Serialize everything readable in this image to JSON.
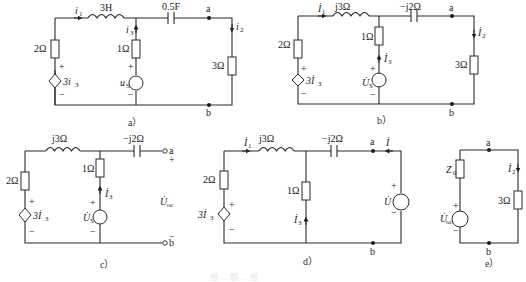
{
  "figure": {
    "caption_faint": "图 … 题 … 图",
    "panels": [
      {
        "id": "a",
        "caption": "a）",
        "elements": {
          "inductor": "3H",
          "capacitor": "0.5F",
          "left_resistor": "2Ω",
          "middle_resistor": "1Ω",
          "right_resistor": "3Ω",
          "dependent_source": "3i",
          "dependent_source_sub": "3",
          "source": "u",
          "source_sub": "S",
          "current_1": "i",
          "current_1_sub": "1",
          "current_2": "i",
          "current_2_sub": "2",
          "current_3": "i",
          "current_3_sub": "3",
          "node_top": "a",
          "node_bottom": "b",
          "plus": "+",
          "minus": "−"
        }
      },
      {
        "id": "b",
        "caption": "b）",
        "elements": {
          "inductor": "j3Ω",
          "capacitor": "−j2Ω",
          "left_resistor": "2Ω",
          "middle_resistor": "1Ω",
          "right_resistor": "3Ω",
          "dependent_source": "3İ",
          "dependent_source_sub": "3",
          "source": "U̇",
          "source_sub": "S",
          "current_1": "İ",
          "current_1_sub": "1",
          "current_2": "İ",
          "current_2_sub": "2",
          "current_3": "İ",
          "current_3_sub": "3",
          "node_top": "a",
          "node_bottom": "b",
          "plus": "+",
          "minus": "−"
        }
      },
      {
        "id": "c",
        "caption": "c）",
        "elements": {
          "inductor": "j3Ω",
          "capacitor": "−j2Ω",
          "left_resistor": "2Ω",
          "middle_resistor": "1Ω",
          "dependent_source": "3İ",
          "dependent_source_sub": "3",
          "source": "U̇",
          "source_sub": "S",
          "current_3": "İ",
          "current_3_sub": "3",
          "open_voltage": "U̇",
          "open_voltage_sub": "oc",
          "node_top": "a",
          "node_bottom": "b",
          "plus": "+",
          "minus": "−"
        }
      },
      {
        "id": "d",
        "caption": "d）",
        "elements": {
          "inductor": "j3Ω",
          "capacitor": "−j2Ω",
          "left_resistor": "2Ω",
          "middle_resistor": "1Ω",
          "dependent_source": "3İ",
          "dependent_source_sub": "3",
          "test_source": "U̇",
          "test_current": "İ",
          "current_1": "İ",
          "current_1_sub": "1",
          "current_3": "İ",
          "current_3_sub": "3",
          "node_top": "a",
          "node_bottom": "b",
          "plus": "+",
          "minus": "−"
        }
      },
      {
        "id": "e",
        "caption": "e）",
        "elements": {
          "impedance": "Z",
          "impedance_sub": "0",
          "right_resistor": "3Ω",
          "source": "U̇",
          "source_sub": "oc",
          "current_2": "İ",
          "current_2_sub": "2",
          "node_top": "a",
          "node_bottom": "b",
          "plus": "+",
          "minus": "−"
        }
      }
    ]
  }
}
